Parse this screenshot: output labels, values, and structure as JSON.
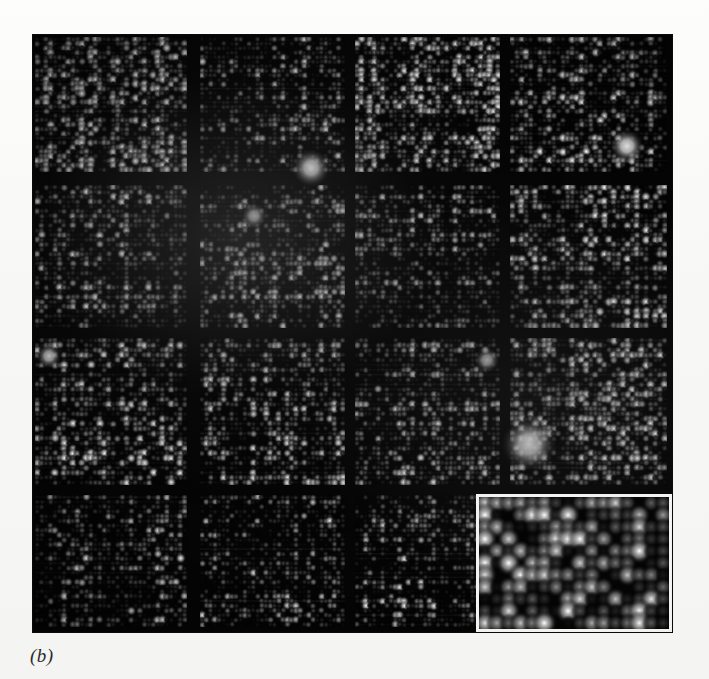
{
  "figure": {
    "caption_label": "(b)",
    "panel": {
      "x": 33,
      "y": 35,
      "width": 639,
      "height": 597,
      "background_color": "#050505",
      "page_background_color": "#f7f7f5"
    },
    "grid": {
      "rows": 4,
      "cols": 4,
      "col_edges": [
        33,
        195,
        350,
        505,
        672
      ],
      "row_edges": [
        35,
        180,
        333,
        490,
        632
      ],
      "block_gap_px": 10,
      "note": "4 x 4 arrangement of print-tip sub-arrays; bottom-right block is covered by the magnified inset"
    },
    "inset": {
      "x": 476,
      "y": 494,
      "width": 196,
      "height": 138,
      "border_color": "#f2f2f0",
      "border_width_px": 3,
      "spot_columns": 16,
      "spot_rows": 11,
      "description": "magnified view of one sub-array showing individual hybridization spots"
    },
    "spot_color_low": "#0a0a0a",
    "spot_color_high": "#ffffff",
    "blocks": [
      {
        "id": "block-r1c1",
        "row": 1,
        "col": 1,
        "mean_intensity": 0.46,
        "spot_cols": 34,
        "spot_rows": 30,
        "seed": 11
      },
      {
        "id": "block-r1c2",
        "row": 1,
        "col": 2,
        "mean_intensity": 0.3,
        "spot_cols": 34,
        "spot_rows": 30,
        "seed": 22
      },
      {
        "id": "block-r1c3",
        "row": 1,
        "col": 3,
        "mean_intensity": 0.4,
        "spot_cols": 34,
        "spot_rows": 30,
        "seed": 33
      },
      {
        "id": "block-r1c4",
        "row": 1,
        "col": 4,
        "mean_intensity": 0.34,
        "spot_cols": 34,
        "spot_rows": 30,
        "seed": 44
      },
      {
        "id": "block-r2c1",
        "row": 2,
        "col": 1,
        "mean_intensity": 0.3,
        "spot_cols": 34,
        "spot_rows": 30,
        "seed": 55
      },
      {
        "id": "block-r2c2",
        "row": 2,
        "col": 2,
        "mean_intensity": 0.36,
        "spot_cols": 34,
        "spot_rows": 30,
        "seed": 66
      },
      {
        "id": "block-r2c3",
        "row": 2,
        "col": 3,
        "mean_intensity": 0.29,
        "spot_cols": 34,
        "spot_rows": 30,
        "seed": 77
      },
      {
        "id": "block-r2c4",
        "row": 2,
        "col": 4,
        "mean_intensity": 0.37,
        "spot_cols": 34,
        "spot_rows": 30,
        "seed": 88
      },
      {
        "id": "block-r3c1",
        "row": 3,
        "col": 1,
        "mean_intensity": 0.34,
        "spot_cols": 34,
        "spot_rows": 30,
        "seed": 99
      },
      {
        "id": "block-r3c2",
        "row": 3,
        "col": 2,
        "mean_intensity": 0.33,
        "spot_cols": 34,
        "spot_rows": 30,
        "seed": 110
      },
      {
        "id": "block-r3c3",
        "row": 3,
        "col": 3,
        "mean_intensity": 0.31,
        "spot_cols": 34,
        "spot_rows": 30,
        "seed": 121
      },
      {
        "id": "block-r3c4",
        "row": 3,
        "col": 4,
        "mean_intensity": 0.42,
        "spot_cols": 34,
        "spot_rows": 30,
        "seed": 132
      },
      {
        "id": "block-r4c1",
        "row": 4,
        "col": 1,
        "mean_intensity": 0.22,
        "spot_cols": 34,
        "spot_rows": 28,
        "seed": 143
      },
      {
        "id": "block-r4c2",
        "row": 4,
        "col": 2,
        "mean_intensity": 0.21,
        "spot_cols": 34,
        "spot_rows": 28,
        "seed": 154
      },
      {
        "id": "block-r4c3",
        "row": 4,
        "col": 3,
        "mean_intensity": 0.23,
        "spot_cols": 34,
        "spot_rows": 28,
        "seed": 165
      },
      {
        "id": "block-r4c4",
        "row": 4,
        "col": 4,
        "mean_intensity": 0.2,
        "spot_cols": 34,
        "spot_rows": 28,
        "seed": 176
      }
    ],
    "bright_features": [
      {
        "name": "saturated-spot-upper-left-block",
        "x": 311,
        "y": 168,
        "radius": 9,
        "intensity": 1.0
      },
      {
        "name": "saturated-spot-upper-right-block",
        "x": 627,
        "y": 146,
        "radius": 8,
        "intensity": 0.95
      },
      {
        "name": "bright-cluster-row3-col4",
        "x": 529,
        "y": 444,
        "radius": 13,
        "intensity": 0.92
      },
      {
        "name": "bright-spot-row2-col2",
        "x": 254,
        "y": 216,
        "radius": 6,
        "intensity": 0.85
      },
      {
        "name": "bright-spot-row3-col1",
        "x": 49,
        "y": 356,
        "radius": 6,
        "intensity": 0.8
      },
      {
        "name": "bright-spot-row3-col3",
        "x": 487,
        "y": 360,
        "radius": 6,
        "intensity": 0.8
      }
    ]
  }
}
